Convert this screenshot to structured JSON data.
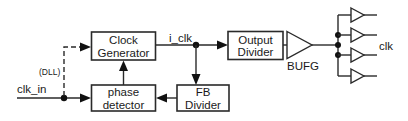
{
  "diagram": {
    "type": "block-diagram",
    "blocks": {
      "clock_generator": {
        "line1": "Clock",
        "line2": "Generator"
      },
      "phase_detector": {
        "line1": "phase",
        "line2": "detector"
      },
      "fb_divider": {
        "line1": "FB",
        "line2": "Divider"
      },
      "output_divider": {
        "line1": "Output",
        "line2": "Divider"
      },
      "bufg": {
        "label": "BUFG"
      }
    },
    "signals": {
      "input": "clk_in",
      "internal": "i_clk",
      "dll_path": "(DLL)",
      "output": "clk"
    },
    "fanout_buffers": 4,
    "connections": [
      {
        "from": "clk_in",
        "to": "phase_detector"
      },
      {
        "from": "clk_in",
        "to": "clock_generator",
        "style": "dashed",
        "label": "(DLL)"
      },
      {
        "from": "phase_detector",
        "to": "clock_generator"
      },
      {
        "from": "clock_generator",
        "to": "output_divider",
        "label": "i_clk"
      },
      {
        "from": "i_clk",
        "to": "fb_divider"
      },
      {
        "from": "fb_divider",
        "to": "phase_detector"
      },
      {
        "from": "output_divider",
        "to": "bufg"
      },
      {
        "from": "bufg",
        "to": "clk buffers (x4)"
      }
    ]
  }
}
